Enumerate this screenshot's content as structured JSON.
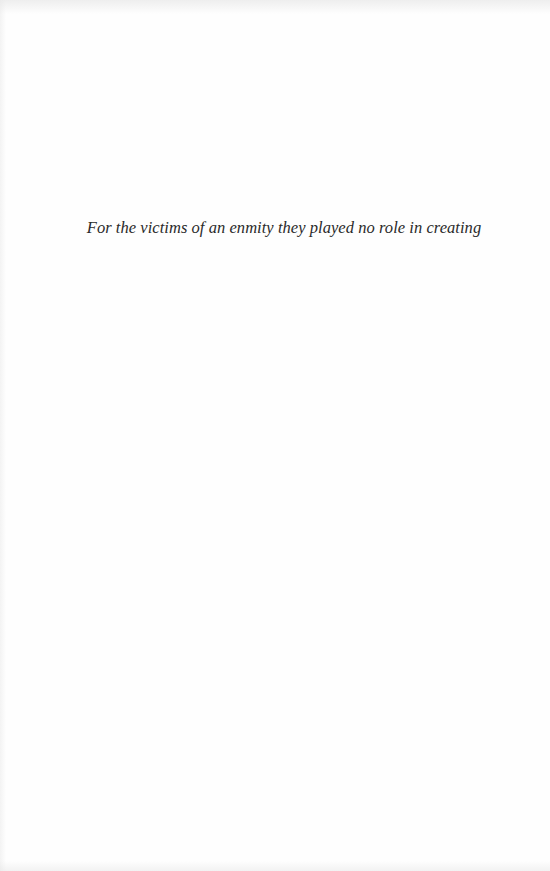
{
  "page": {
    "background_color": "#ffffff",
    "text_color": "#2a2a2a"
  },
  "dedication": {
    "text": "For the victims of an enmity they played no role in creating"
  }
}
